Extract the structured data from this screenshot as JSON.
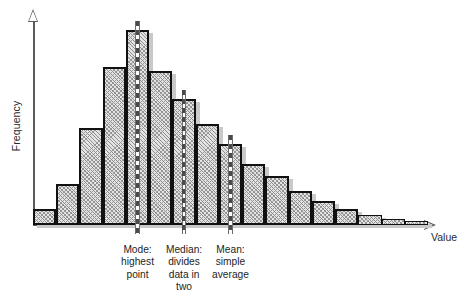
{
  "figure": {
    "type": "statistics-histogram-diagram",
    "axes": {
      "y_label": "Frequency",
      "x_label": "Value",
      "y_arrow_icon": "arrow-up-icon",
      "x_arrow_icon": "arrow-right-icon"
    }
  },
  "annotations": [
    {
      "id": "mode",
      "line1": "Mode:",
      "line2": "highest",
      "line3": "point",
      "line4": ""
    },
    {
      "id": "median",
      "line1": "Median:",
      "line2": "divides",
      "line3": "data in",
      "line4": "two"
    },
    {
      "id": "mean",
      "line1": "Mean:",
      "line2": "simple",
      "line3": "average",
      "line4": ""
    }
  ],
  "chart_data": {
    "type": "bar",
    "title": "",
    "xlabel": "Value",
    "ylabel": "Frequency",
    "grid": false,
    "legend": null,
    "distribution": "right-skewed (positively skewed)",
    "categories": [
      "1",
      "2",
      "3",
      "4",
      "5",
      "6",
      "7",
      "8",
      "9",
      "10",
      "11",
      "12",
      "13",
      "14",
      "15",
      "16",
      "17"
    ],
    "values": [
      8,
      20,
      48,
      78,
      96,
      76,
      62,
      50,
      40,
      30,
      24,
      17,
      12,
      8,
      5,
      3,
      2
    ],
    "ylim": [
      0,
      100
    ],
    "bar_colors": {
      "fill": "#e3e3e3",
      "hatch": "#8f8f8f",
      "edge": "#111111",
      "shadow": "#c9c9c9"
    },
    "markers": [
      {
        "name": "Mode",
        "category_index": 4,
        "value": 96,
        "style": "dashed-vertical"
      },
      {
        "name": "Median",
        "category_index": 6,
        "value": 62,
        "style": "dashed-vertical"
      },
      {
        "name": "Mean",
        "category_index": 8,
        "value": 40,
        "style": "dashed-vertical"
      }
    ]
  }
}
